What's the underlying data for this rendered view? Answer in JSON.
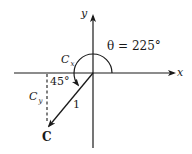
{
  "diagram": {
    "axes": {
      "x_label": "x",
      "y_label": "y"
    },
    "angle_label": "θ = 225°",
    "reference_angle_label": "45°",
    "components": {
      "cx_main": "C",
      "cx_sub": "x",
      "cy_main": "C",
      "cy_sub": "y"
    },
    "vector": {
      "name": "C",
      "magnitude_label": "1",
      "angle_deg": 225
    },
    "colors": {
      "stroke": "#1a1a1a",
      "background": "#ffffff"
    }
  }
}
